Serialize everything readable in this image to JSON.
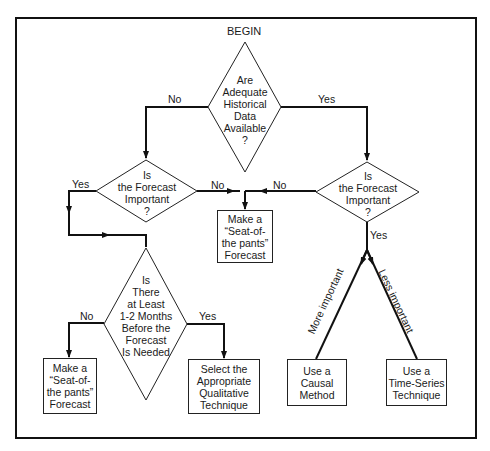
{
  "diagram": {
    "title": "BEGIN",
    "decisions": {
      "historical_data": "Are\nAdequate\nHistorical\nData\nAvailable\n?",
      "forecast_important_left": "Is\nthe Forecast\nImportant\n?",
      "forecast_important_right": "Is\nthe Forecast\nImportant\n?",
      "lead_time": "Is\nThere\nat Least\n1-2 Months\nBefore the\nForecast\nIs Needed"
    },
    "actions": {
      "seat_of_pants_middle": "Make a\n“Seat-of-\nthe pants”\nForecast",
      "seat_of_pants_bottom": "Make a\n“Seat-of-\nthe pants”\nForecast",
      "qualitative": "Select the\nAppropriate\nQualitative\nTechnique",
      "causal": "Use a\nCausal\nMethod",
      "time_series": "Use a\nTime-Series\nTechnique"
    },
    "edge_labels": {
      "top_no": "No",
      "top_yes": "Yes",
      "left_yes": "Yes",
      "left_no": "No",
      "right_no": "No",
      "right_yes": "Yes",
      "lead_no": "No",
      "lead_yes": "Yes",
      "more_important": "More important",
      "less_important": "Less important"
    }
  }
}
